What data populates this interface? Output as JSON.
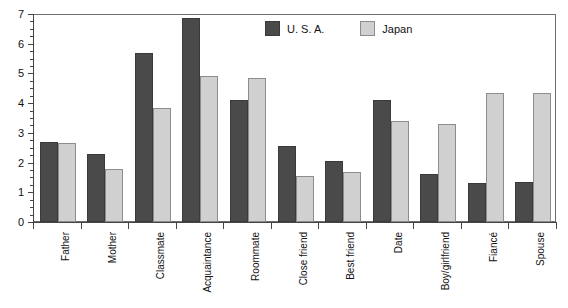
{
  "chart_data": {
    "type": "bar",
    "title": "",
    "xlabel": "",
    "ylabel": "",
    "ylim": [
      0,
      7
    ],
    "y_ticks": [
      0,
      1,
      2,
      3,
      4,
      5,
      6,
      7
    ],
    "y_minor_tick_step": 0.25,
    "grid": false,
    "legend_position": "top-center",
    "categories": [
      "Father",
      "Mother",
      "Classmate",
      "Acquaintance",
      "Roommate",
      "Close friend",
      "Best friend",
      "Date",
      "Boy/girlfriend",
      "Fiancé",
      "Spouse"
    ],
    "series": [
      {
        "name": "U. S. A.",
        "color": "#4a4a4a",
        "values": [
          2.7,
          2.3,
          5.7,
          6.85,
          4.1,
          2.55,
          2.05,
          4.1,
          1.6,
          1.3,
          1.35
        ]
      },
      {
        "name": "Japan",
        "color": "#d0d0d0",
        "values": [
          2.65,
          1.8,
          3.85,
          4.9,
          4.85,
          1.55,
          1.7,
          3.4,
          3.3,
          4.35,
          4.35
        ]
      }
    ]
  },
  "legend": {
    "items": [
      {
        "label": "U. S. A.",
        "swatch": "usa"
      },
      {
        "label": "Japan",
        "swatch": "japan"
      }
    ]
  },
  "axis": {
    "y_tick_labels": [
      "0",
      "1",
      "2",
      "3",
      "4",
      "5",
      "6",
      "7"
    ]
  }
}
